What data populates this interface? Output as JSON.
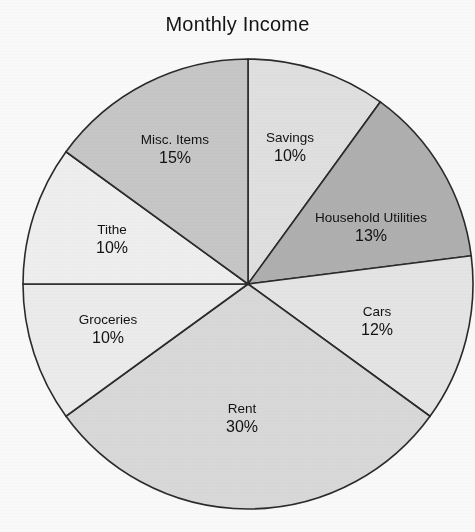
{
  "chart_data": {
    "type": "pie",
    "title": "Monthly Income",
    "xlabel": "",
    "ylabel": "",
    "legend": "none",
    "grid": false,
    "value_suffix": "%",
    "start_angle_deg": 0,
    "direction": "clockwise",
    "categories": [
      "Savings",
      "Household Utilities",
      "Cars",
      "Rent",
      "Groceries",
      "Tithe",
      "Misc. Items"
    ],
    "values": [
      10,
      13,
      12,
      30,
      10,
      10,
      15
    ],
    "slices": [
      {
        "label": "Savings",
        "value": 10,
        "value_text": "10%",
        "color": "#e3e3e3",
        "start_deg": 0,
        "end_deg": 36,
        "label_x": 290,
        "label_y": 148
      },
      {
        "label": "Household Utilities",
        "value": 13,
        "value_text": "13%",
        "color": "#b2b2b2",
        "start_deg": 36,
        "end_deg": 82.8,
        "label_x": 371,
        "label_y": 228
      },
      {
        "label": "Cars",
        "value": 12,
        "value_text": "12%",
        "color": "#e8e8e8",
        "start_deg": 82.8,
        "end_deg": 126,
        "label_x": 377,
        "label_y": 322
      },
      {
        "label": "Rent",
        "value": 30,
        "value_text": "30%",
        "color": "#dcdcdc",
        "start_deg": 126,
        "end_deg": 234,
        "label_x": 242,
        "label_y": 419
      },
      {
        "label": "Groceries",
        "value": 10,
        "value_text": "10%",
        "color": "#efefef",
        "start_deg": 234,
        "end_deg": 270,
        "label_x": 108,
        "label_y": 330
      },
      {
        "label": "Tithe",
        "value": 10,
        "value_text": "10%",
        "color": "#f2f2f2",
        "start_deg": 270,
        "end_deg": 306,
        "label_x": 112,
        "label_y": 240
      },
      {
        "label": "Misc. Items",
        "value": 15,
        "value_text": "15%",
        "color": "#c9c9c9",
        "start_deg": 306,
        "end_deg": 360,
        "label_x": 175,
        "label_y": 150
      }
    ],
    "geometry": {
      "center_x": 248,
      "center_y": 284,
      "radius": 225,
      "outline_color": "#2b2b2b"
    }
  }
}
